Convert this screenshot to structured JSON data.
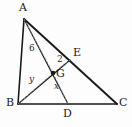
{
  "figure": {
    "type": "geometry-diagram",
    "background_color": "#fdfdfd",
    "stroke_color": "#1a1a1a",
    "dashed_color": "#8c8c8c",
    "points": {
      "A": {
        "x": 24,
        "y": 19,
        "label": "A",
        "label_x": 19,
        "label_y": 4
      },
      "B": {
        "x": 18,
        "y": 104,
        "label": "B",
        "label_x": 8,
        "label_y": 98
      },
      "C": {
        "x": 117,
        "y": 104,
        "label": "C",
        "label_x": 119,
        "label_y": 98
      },
      "D": {
        "x": 68,
        "y": 104,
        "label": "D",
        "label_x": 64,
        "label_y": 108
      },
      "E": {
        "x": 70,
        "y": 60,
        "label": "E",
        "label_x": 73,
        "label_y": 48
      },
      "G": {
        "x": 53,
        "y": 73,
        "label": "G",
        "label_x": 56,
        "label_y": 69
      }
    },
    "solid_segments": [
      {
        "name": "AB",
        "from": "A",
        "to": "B"
      },
      {
        "name": "AC",
        "from": "A",
        "to": "C"
      },
      {
        "name": "BC",
        "from": "B",
        "to": "C"
      },
      {
        "name": "AD",
        "from": "A",
        "to": "D"
      },
      {
        "name": "BE",
        "from": "B",
        "to": "E"
      }
    ],
    "dashed_segments": [
      {
        "name": "AG-dashed",
        "from": "A",
        "to": "G"
      },
      {
        "name": "BG-dashed",
        "from": "B",
        "to": "G"
      },
      {
        "name": "GD-dashed",
        "from": "G",
        "to": "D"
      },
      {
        "name": "GE-dashed",
        "from": "G",
        "to": "E"
      }
    ],
    "segment_labels": [
      {
        "name": "label-6",
        "text": "6",
        "x": 29,
        "y": 48,
        "style": "num"
      },
      {
        "name": "label-2",
        "text": "2",
        "x": 57,
        "y": 57,
        "style": "num"
      },
      {
        "name": "label-y",
        "text": "y",
        "x": 29,
        "y": 77,
        "style": "var"
      },
      {
        "name": "label-x",
        "text": "x",
        "x": 54,
        "y": 84,
        "style": "var"
      }
    ]
  }
}
